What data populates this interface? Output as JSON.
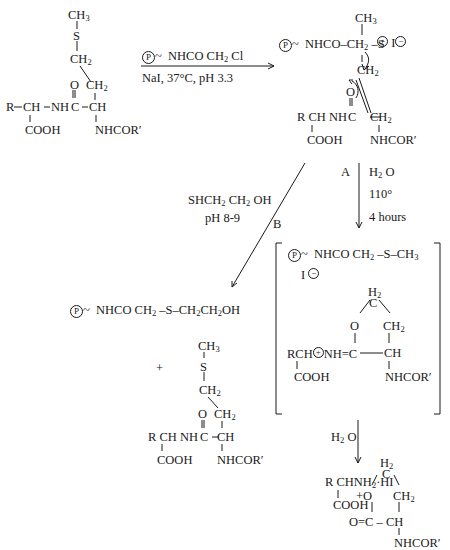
{
  "diagram": {
    "type": "reaction-scheme",
    "starting_material": {
      "rows": [
        "CH3",
        "S",
        "CH2",
        "O CH2",
        "R–CH–NH C–CH",
        "COOH",
        "NHCOR′"
      ]
    },
    "step1": {
      "reagent": "Ⓟ~ NHCO CH2 Cl",
      "conditions": "NaI, 37°C, pH 3.3"
    },
    "sulfonium_intermediate": {
      "top": "Ⓟ~ NHCO–CH2–S",
      "methyl": "CH3",
      "charge": "⊕ I⊖",
      "rows": [
        "CH2",
        "O",
        "R CH NH C–CH2",
        "COOH",
        "NHCOR′"
      ]
    },
    "path_A": {
      "label": "A",
      "conditions": [
        "H2O",
        "110°",
        "4 hours"
      ]
    },
    "path_B": {
      "label": "B",
      "conditions": [
        "SHCH2CH2OH",
        "pH 8-9"
      ]
    },
    "iminolactone_intermediate": {
      "top": "Ⓟ~ NHCO CH2–S–CH3",
      "counterion": "I⊖",
      "ring": [
        "H2",
        "C",
        "O",
        "CH2",
        "RCH⊕NH=C",
        "CH",
        "COOH",
        "NHCOR′"
      ]
    },
    "hydrolysis": {
      "conditions": "H2O"
    },
    "path_B_products": {
      "product1": "Ⓟ~ NHCO CH2–S–CH2CH2OH",
      "plus": "+",
      "product2_rows": [
        "CH3",
        "S",
        "CH2",
        "O CH2",
        "RCH NH C–CH",
        "COOH",
        "NHCOR′"
      ]
    },
    "final_products": {
      "amine": "R CHNH2·HI",
      "amine_cooh": "COOH",
      "lactone_rows": [
        "H2",
        "C",
        "+O",
        "CH2",
        "O=C – CH",
        "NHCOR′"
      ]
    }
  },
  "labels": {
    "CH3": "CH",
    "sub3": "3",
    "sub2": "2",
    "S": "S",
    "CH2": "CH",
    "O": "O",
    "C": "C",
    "CH": "CH",
    "R": "R",
    "NH": "NH",
    "COOH": "COOH",
    "NHCORp": "NHCOR′",
    "P": "P",
    "tilde": "~",
    "NHCO": "NHCO",
    "Cl": "Cl",
    "NaI": "NaI, 37°C, pH 3.3",
    "A": "A",
    "B": "B",
    "H": "H",
    "Obig": "O",
    "deg110": "110°",
    "hours": "4 hours",
    "SH": "SHCH",
    "CH2OH": "CH",
    "OH": "OH",
    "pH89": "pH 8-9",
    "plus": "+",
    "I": "I",
    "minus": "−",
    "pluscharge": "+",
    "HI": "·HI",
    "NH2": "NH",
    "RCH": "RCH",
    "Rsp": "R CH",
    "ring_eq": "NH=C",
    "OeqC": "O=C",
    "dash": "–",
    "Oplus": "+O"
  }
}
